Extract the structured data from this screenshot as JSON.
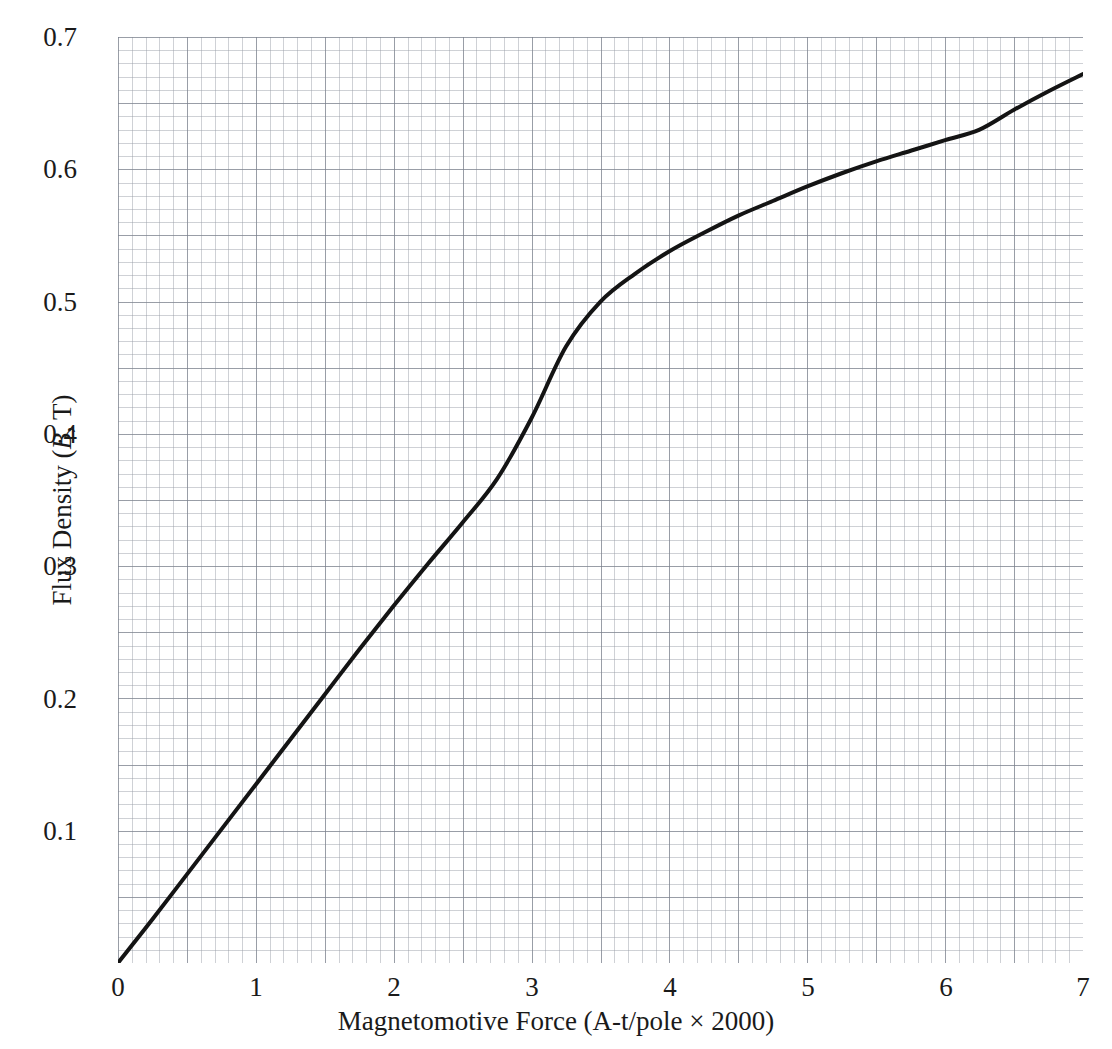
{
  "chart_data": {
    "type": "line",
    "title": "",
    "xlabel": "Magnetomotive Force (A-t/pole × 2000)",
    "ylabel_parts": {
      "prefix": "Flux Density (",
      "symbol": "B",
      "suffix": ", T)"
    },
    "ylabel": "Flux Density (B, T)",
    "xlim": [
      0,
      7
    ],
    "ylim": [
      0,
      0.7
    ],
    "grid": "graph-paper, fine cells every 0.05 x-unit and 0.005 T with heavier lines every 5 cells",
    "legend": "none",
    "xticks": [
      "0",
      "1",
      "2",
      "3",
      "4",
      "5",
      "6",
      "7"
    ],
    "xtick_values": [
      0,
      1,
      2,
      3,
      4,
      5,
      6,
      7
    ],
    "yticks": [
      "0.1",
      "0.2",
      "0.3",
      "0.4",
      "0.5",
      "0.6",
      "0.7"
    ],
    "ytick_values": [
      0.1,
      0.2,
      0.3,
      0.4,
      0.5,
      0.6,
      0.7
    ],
    "series": [
      {
        "name": "Magnetization curve",
        "color": "#141414",
        "line_width": 4,
        "x": [
          0,
          0.25,
          0.5,
          0.75,
          1.0,
          1.25,
          1.5,
          1.75,
          2.0,
          2.25,
          2.5,
          2.75,
          3.0,
          3.25,
          3.5,
          3.75,
          4.0,
          4.25,
          4.5,
          4.75,
          5.0,
          5.25,
          5.5,
          5.75,
          6.0,
          6.25,
          6.5,
          6.75,
          7.0
        ],
        "y": [
          0.0,
          0.033,
          0.067,
          0.101,
          0.135,
          0.169,
          0.203,
          0.237,
          0.27,
          0.302,
          0.333,
          0.366,
          0.412,
          0.466,
          0.5,
          0.521,
          0.538,
          0.552,
          0.565,
          0.576,
          0.587,
          0.597,
          0.606,
          0.614,
          0.622,
          0.63,
          0.645,
          0.659,
          0.672
        ]
      }
    ],
    "annotations": []
  },
  "axes": {
    "x_title": "Magnetomotive Force (A-t/pole × 2000)",
    "y_title_prefix": "Flux Density (",
    "y_title_symbol": "B",
    "y_title_suffix": ", T)",
    "x_tick_labels": [
      "0",
      "1",
      "2",
      "3",
      "4",
      "5",
      "6",
      "7"
    ],
    "y_tick_labels": [
      "0.1",
      "0.2",
      "0.3",
      "0.4",
      "0.5",
      "0.6",
      "0.7"
    ]
  },
  "colors": {
    "curve": "#141414",
    "grid_fine": "#969ba5",
    "grid_major": "#787e8a",
    "background": "#ffffff",
    "text": "#1a1a1a"
  }
}
